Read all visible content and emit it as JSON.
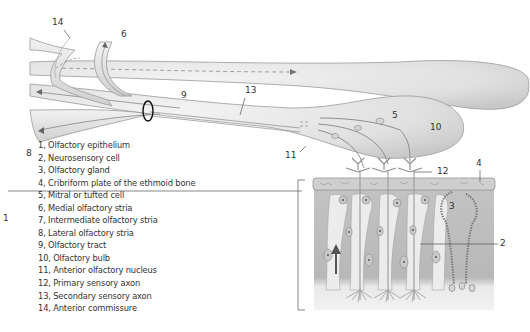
{
  "diagram": {
    "callouts": [
      {
        "number": "1",
        "x": 5,
        "y": 245
      },
      {
        "number": "2",
        "x": 500,
        "y": 244
      },
      {
        "number": "3",
        "x": 448,
        "y": 208
      },
      {
        "number": "4",
        "x": 478,
        "y": 166
      },
      {
        "number": "5",
        "x": 392,
        "y": 117
      },
      {
        "number": "6",
        "x": 122,
        "y": 37
      },
      {
        "number": "7",
        "x": 0,
        "y": 0
      },
      {
        "number": "8",
        "x": 26,
        "y": 155
      },
      {
        "number": "9",
        "x": 181,
        "y": 97
      },
      {
        "number": "10",
        "x": 430,
        "y": 128
      },
      {
        "number": "11",
        "x": 285,
        "y": 158
      },
      {
        "number": "12",
        "x": 436,
        "y": 173
      },
      {
        "number": "13",
        "x": 245,
        "y": 93
      },
      {
        "number": "14",
        "x": 52,
        "y": 25
      }
    ],
    "colors": {
      "tract_fill": "#e3e3e3",
      "tract_stroke": "#9a9a9a",
      "bulb_fill": "#e8e8e8",
      "tissue_fill": "#bdbdbd",
      "cell_fill": "#ececec",
      "nucleus": "#7a7a7a",
      "arrow": "#555555",
      "label_text": "#333333",
      "ring": "#111111"
    }
  },
  "legend": {
    "items": [
      "1, Olfactory epithelium",
      "2, Neurosensory cell",
      "3, Olfactory gland",
      "4, Cribriform plate of the ethmoid bone",
      "5, Mitral or tufted cell",
      "6, Medial olfactory stria",
      "7, Intermediate olfactory stria",
      "8, Lateral olfactory stria",
      "9, Olfactory tract",
      "10, Olfactory bulb",
      "11, Anterior olfactory nucleus",
      "12, Primary sensory axon",
      "13, Secondary sensory axon",
      "14, Anterior commissure"
    ]
  }
}
